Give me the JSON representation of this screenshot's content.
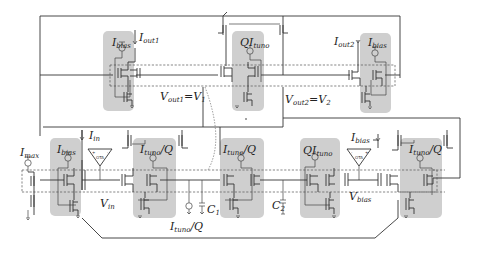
{
  "figure": {
    "type": "transistor-level circuit schematic",
    "background": "#ffffff",
    "shade_color": "#cfcfcf",
    "wire_color": "#333333"
  },
  "labels": {
    "top_row": {
      "ibias_left": {
        "main": "I",
        "sub": "bias"
      },
      "iout1": {
        "main": "I",
        "sub": "out1"
      },
      "qituno_top": {
        "pre": "QI",
        "sub": "tuno"
      },
      "iout2": {
        "main": "I",
        "sub": "out2"
      },
      "ibias_right": {
        "main": "I",
        "sub": "bias"
      },
      "vout1": {
        "main": "V",
        "sub": "out1",
        "eq": "=V",
        "eq_sub": "1"
      },
      "vout2": {
        "main": "V",
        "sub": "out2",
        "eq": "=V",
        "eq_sub": "2"
      }
    },
    "bottom_row": {
      "imax": {
        "main": "I",
        "sub": "max"
      },
      "ibias_bl": {
        "main": "I",
        "sub": "bias"
      },
      "iin": {
        "main": "I",
        "sub": "in"
      },
      "ituno_q_1": {
        "main": "I",
        "sub": "tuno",
        "post": "/Q"
      },
      "ituno_q_2": {
        "main": "I",
        "sub": "tuno",
        "post": "/Q"
      },
      "qituno_bottom": {
        "pre": "QI",
        "sub": "tuno"
      },
      "ibias_br": {
        "main": "I",
        "sub": "bias"
      },
      "ituno_q_3": {
        "main": "I",
        "sub": "tuno",
        "post": "/Q"
      },
      "vin": {
        "main": "V",
        "sub": "in"
      },
      "vbias": {
        "main": "V",
        "sub": "bias"
      },
      "c1": {
        "main": "C",
        "sub": "1"
      },
      "c2": {
        "main": "C",
        "sub": "2"
      },
      "ituno_q_source": {
        "main": "I",
        "sub": "tuno",
        "post": "/Q"
      }
    },
    "ota_left": {
      "plus": "+",
      "minus": "-",
      "name": "OTA"
    },
    "ota_right": {
      "plus": "-",
      "minus": "+",
      "name": "OTA"
    }
  },
  "components": {
    "shaded_blocks": 8,
    "otas": 2,
    "capacitors": [
      "C1",
      "C2"
    ],
    "current_sources": [
      "Ibias",
      "QItuno",
      "Ibias",
      "Imax",
      "Ibias",
      "Ituno/Q",
      "Ituno/Q",
      "QItuno",
      "Ituno/Q",
      "Ituno/Q"
    ]
  }
}
